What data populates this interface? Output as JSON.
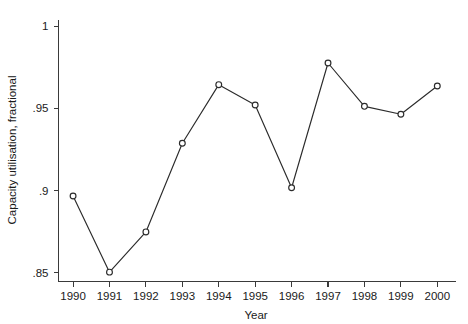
{
  "chart_data": {
    "type": "line",
    "title": "",
    "xlabel": "Year",
    "ylabel": "Capacity utilisation, fractional",
    "x": [
      1990,
      1991,
      1992,
      1993,
      1994,
      1995,
      1996,
      1997,
      1998,
      1999,
      2000
    ],
    "categories": [
      "1990",
      "1991",
      "1992",
      "1993",
      "1994",
      "1995",
      "1996",
      "1997",
      "1998",
      "1999",
      "2000"
    ],
    "values": [
      0.8967,
      0.8503,
      0.8748,
      0.9288,
      0.9645,
      0.9521,
      0.9017,
      0.9777,
      0.9513,
      0.9465,
      0.9637
    ],
    "series": [
      {
        "name": "Capacity utilisation",
        "values": [
          0.8967,
          0.8503,
          0.8748,
          0.9288,
          0.9645,
          0.9521,
          0.9017,
          0.9777,
          0.9513,
          0.9465,
          0.9637
        ]
      }
    ],
    "xlim": [
      1989.6,
      2000.5
    ],
    "ylim": [
      0.8446,
      1.0042
    ],
    "yticks": [
      0.85,
      0.9,
      0.95,
      1
    ],
    "ytick_labels": [
      ".85",
      ".9",
      ".95",
      "1"
    ],
    "xticks": [
      1990,
      1991,
      1992,
      1993,
      1994,
      1995,
      1996,
      1997,
      1998,
      1999,
      2000
    ],
    "xtick_labels": [
      "1990",
      "1991",
      "1992",
      "1993",
      "1994",
      "1995",
      "1996",
      "1997",
      "1998",
      "1999",
      "2000"
    ],
    "grid": false,
    "legend": false,
    "legend_position": "none",
    "marker": "open-circle",
    "line_color": "#2b2b2b",
    "marker_fill": "#ffffff",
    "background_color": "#ffffff"
  }
}
